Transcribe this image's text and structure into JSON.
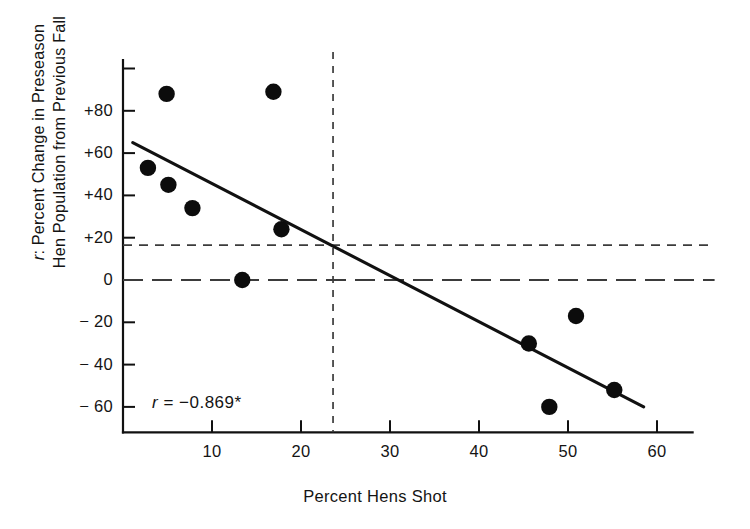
{
  "chart_data": {
    "type": "scatter",
    "title": "",
    "xlabel": "Percent Hens Shot",
    "ylabel": "r: Percent Change in Preseason Hen Population from Previous Fall",
    "ylabel_line1": "r: Percent Change in Preseason",
    "ylabel_line2": "Hen Population from Previous Fall",
    "xlim": [
      0,
      64
    ],
    "ylim": [
      -72,
      104
    ],
    "grid": false,
    "legend": "none",
    "xticks": [
      10,
      20,
      30,
      40,
      50,
      60
    ],
    "xtick_labels": [
      "10",
      "20",
      "30",
      "40",
      "50",
      "60"
    ],
    "yticks": [
      100,
      80,
      60,
      40,
      20,
      0,
      -20,
      -40,
      -60
    ],
    "ytick_labels": [
      "",
      "+80",
      "+60",
      "+40",
      "+20",
      "0",
      "− 20",
      "− 40",
      "− 60"
    ],
    "points": [
      {
        "x": 4.9,
        "y": 88
      },
      {
        "x": 16.9,
        "y": 89
      },
      {
        "x": 2.8,
        "y": 53
      },
      {
        "x": 5.1,
        "y": 45
      },
      {
        "x": 7.8,
        "y": 34
      },
      {
        "x": 17.8,
        "y": 24
      },
      {
        "x": 13.4,
        "y": 0
      },
      {
        "x": 50.9,
        "y": -17
      },
      {
        "x": 45.6,
        "y": -30
      },
      {
        "x": 47.9,
        "y": -60
      },
      {
        "x": 55.2,
        "y": -52
      }
    ],
    "trend_line": {
      "x0": 1.1,
      "y0": 65,
      "x1": 58.5,
      "y1": -60
    },
    "reference_lines": [
      {
        "orientation": "vertical",
        "value": 23.6,
        "style": "dashed"
      },
      {
        "orientation": "horizontal",
        "value": 16.5,
        "style": "dashed-short"
      },
      {
        "orientation": "horizontal",
        "value": 0,
        "style": "dashed-long"
      }
    ],
    "annotations": [
      {
        "id": "correlation",
        "text_symbol": "r",
        "text_rest": " =  −0.869*",
        "x": 13,
        "y": -58
      }
    ]
  }
}
